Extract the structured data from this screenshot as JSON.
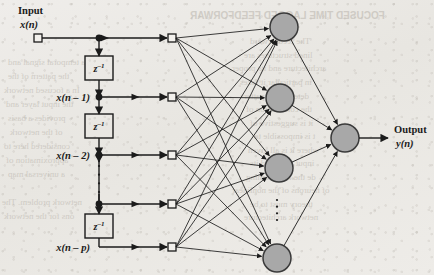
{
  "figure": {
    "type": "neural-network-diagram",
    "width": 434,
    "height": 275,
    "background_color": "#eceae6",
    "ink_color": "#1b1b1b",
    "neuron_fill": "#a8a8a8",
    "neuron_stroke": "#3a3a3a"
  },
  "labels": {
    "input_title": "Input",
    "input_signal": "x(n)",
    "output_title": "Output",
    "output_signal": "y(n)",
    "delay_operator": "z",
    "delay_exponent": "–1"
  },
  "tap_delay_line": {
    "taps": [
      {
        "id": "tap-0",
        "label": "x(n)",
        "y": 38,
        "has_dot": true,
        "has_input_square": true,
        "show_label_above": true
      },
      {
        "id": "tap-1",
        "label": "x(n – 1)",
        "y": 97,
        "has_dot": true,
        "has_input_square": true,
        "show_label_above": false
      },
      {
        "id": "tap-2",
        "label": "x(n – 2)",
        "y": 155,
        "has_dot": true,
        "has_input_square": true,
        "show_label_above": false
      },
      {
        "id": "tap-3",
        "label": "",
        "y": 204,
        "has_dot": true,
        "has_input_square": true,
        "show_label_above": false
      },
      {
        "id": "tap-4",
        "label": "x(n – p)",
        "y": 247,
        "has_dot": false,
        "has_input_square": true,
        "show_label_above": false
      }
    ],
    "delay_blocks": [
      {
        "id": "delay-1",
        "y_center": 68
      },
      {
        "id": "delay-2",
        "y_center": 126
      },
      {
        "id": "delay-3",
        "y_center": 226
      }
    ],
    "vertical_ellipsis": {
      "x": 99,
      "y_from": 166,
      "y_to": 192,
      "dots": 4
    },
    "line_x": 99,
    "square_x": 172,
    "block_x": 85,
    "block_width": 28,
    "block_height": 24
  },
  "hidden_layer": {
    "name": "hidden-layer",
    "neurons": [
      {
        "id": "hidden-1",
        "cx": 284,
        "cy": 27
      },
      {
        "id": "hidden-2",
        "cx": 280,
        "cy": 98
      },
      {
        "id": "hidden-3",
        "cx": 279,
        "cy": 168
      },
      {
        "id": "hidden-4",
        "cx": 277,
        "cy": 258
      }
    ],
    "radius": 14,
    "vertical_ellipsis": {
      "x": 277,
      "y_from": 200,
      "y_to": 220,
      "dots": 4
    }
  },
  "output_layer": {
    "name": "output-layer",
    "neuron": {
      "id": "output-neuron",
      "cx": 345,
      "cy": 138,
      "radius": 14
    },
    "arrow_end_x": 388
  },
  "bleed_through_text": [
    {
      "text": "FOCUSED TIME LAGGED FEEDFORWAR",
      "x": 190,
      "y": 10,
      "size": 10,
      "bold": true
    },
    {
      "text": "The feedforward",
      "x": 250,
      "y": 36,
      "size": 9
    },
    {
      "text": "lined structures are",
      "x": 244,
      "y": 50,
      "size": 9
    },
    {
      "text": "architecture and its proper",
      "x": 232,
      "y": 63,
      "size": 9
    },
    {
      "text": "in particular it takes",
      "x": 240,
      "y": 77,
      "size": 9
    },
    {
      "text": "determine a patter",
      "x": 244,
      "y": 91,
      "size": 9
    },
    {
      "text": "the convolution of",
      "x": 246,
      "y": 104,
      "size": 9
    },
    {
      "text": "it is suggestive of",
      "x": 250,
      "y": 118,
      "size": 9
    },
    {
      "text": "t is impossible to",
      "x": 254,
      "y": 131,
      "size": 9
    },
    {
      "text": "where it is all given",
      "x": 248,
      "y": 145,
      "size": 9
    },
    {
      "text": "input node and its",
      "x": 250,
      "y": 158,
      "size": 9
    },
    {
      "text": "de the free learning",
      "x": 246,
      "y": 172,
      "size": 9
    },
    {
      "text": "of neurons of the nonlinear",
      "x": 232,
      "y": 185,
      "size": 9
    },
    {
      "text": "theory must to be",
      "x": 250,
      "y": 199,
      "size": 9
    },
    {
      "text": "network architecture",
      "x": 244,
      "y": 212,
      "size": 9
    },
    {
      "text": "a temporal signal and",
      "x": 8,
      "y": 57,
      "size": 9
    },
    {
      "text": "the pattern of the",
      "x": 8,
      "y": 71,
      "size": 9
    },
    {
      "text": "In a focused network",
      "x": 4,
      "y": 85,
      "size": 9
    },
    {
      "text": "the input layer and",
      "x": 6,
      "y": 99,
      "size": 9
    },
    {
      "text": "provides a basis",
      "x": 8,
      "y": 113,
      "size": 9
    },
    {
      "text": "of the network",
      "x": 10,
      "y": 127,
      "size": 9
    },
    {
      "text": "considered here to",
      "x": 4,
      "y": 141,
      "size": 9
    },
    {
      "text": "approximation of",
      "x": 6,
      "y": 155,
      "size": 9
    },
    {
      "text": "a universal map",
      "x": 8,
      "y": 169,
      "size": 9
    },
    {
      "text": "network problem. The",
      "x": 2,
      "y": 197,
      "size": 9
    },
    {
      "text": "ons for the network",
      "x": 4,
      "y": 211,
      "size": 9
    }
  ]
}
